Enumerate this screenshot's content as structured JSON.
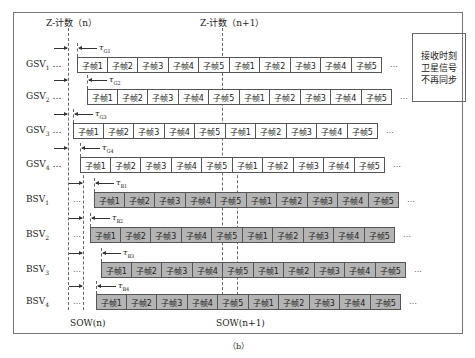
{
  "header": {
    "zcount_n": "Z-计数（n）",
    "zcount_n1": "Z-计数（n+1）"
  },
  "footer": {
    "sow_n": "SOW(n)",
    "sow_n1": "SOW(n+1)"
  },
  "note": {
    "lines": [
      "接收时刻",
      "卫星信号",
      "不再同步"
    ]
  },
  "caption": "（b）",
  "ellipsis": "…",
  "rows": [
    {
      "label": "GSV",
      "sub": "1",
      "tau": "τ",
      "tau_sub": "G1",
      "type": "g",
      "cells": [
        "子帧1",
        "子帧2",
        "子帧3",
        "子帧4",
        "子帧5",
        "子帧1",
        "子帧2",
        "子帧3",
        "子帧4",
        "子帧5"
      ]
    },
    {
      "label": "GSV",
      "sub": "2",
      "tau": "τ",
      "tau_sub": "G2",
      "type": "g",
      "cells": [
        "子帧1",
        "子帧2",
        "子帧3",
        "子帧4",
        "子帧5",
        "子帧1",
        "子帧2",
        "子帧3",
        "子帧4",
        "子帧5"
      ]
    },
    {
      "label": "GSV",
      "sub": "3",
      "tau": "τ",
      "tau_sub": "G3",
      "type": "g",
      "cells": [
        "子帧1",
        "子帧2",
        "子帧3",
        "子帧4",
        "子帧5",
        "子帧1",
        "子帧2",
        "子帧3",
        "子帧4",
        "子帧5"
      ]
    },
    {
      "label": "GSV",
      "sub": "4",
      "tau": "τ",
      "tau_sub": "G4",
      "type": "g",
      "cells": [
        "子帧1",
        "子帧2",
        "子帧3",
        "子帧4",
        "子帧5",
        "子帧1",
        "子帧2",
        "子帧3",
        "子帧4",
        "子帧5"
      ]
    },
    {
      "label": "BSV",
      "sub": "1",
      "tau": "τ",
      "tau_sub": "B1",
      "type": "b",
      "cells": [
        "子帧1",
        "子帧2",
        "子帧3",
        "子帧4",
        "子帧5",
        "子帧1",
        "子帧2",
        "子帧3",
        "子帧4",
        "子帧5"
      ]
    },
    {
      "label": "BSV",
      "sub": "2",
      "tau": "τ",
      "tau_sub": "B2",
      "type": "b",
      "cells": [
        "子帧1",
        "子帧2",
        "子帧3",
        "子帧4",
        "子帧5",
        "子帧1",
        "子帧2",
        "子帧3",
        "子帧4",
        "子帧5"
      ]
    },
    {
      "label": "BSV",
      "sub": "3",
      "tau": "τ",
      "tau_sub": "B3",
      "type": "b",
      "cells": [
        "子帧1",
        "子帧2",
        "子帧3",
        "子帧4",
        "子帧5",
        "子帧1",
        "子帧2",
        "子帧3",
        "子帧4",
        "子帧5"
      ]
    },
    {
      "label": "BSV",
      "sub": "4",
      "tau": "τ",
      "tau_sub": "B4",
      "type": "b",
      "cells": [
        "子帧1",
        "子帧2",
        "子帧3",
        "子帧4",
        "子帧5",
        "子帧1",
        "子帧2",
        "子帧3",
        "子帧4",
        "子帧5"
      ]
    }
  ]
}
